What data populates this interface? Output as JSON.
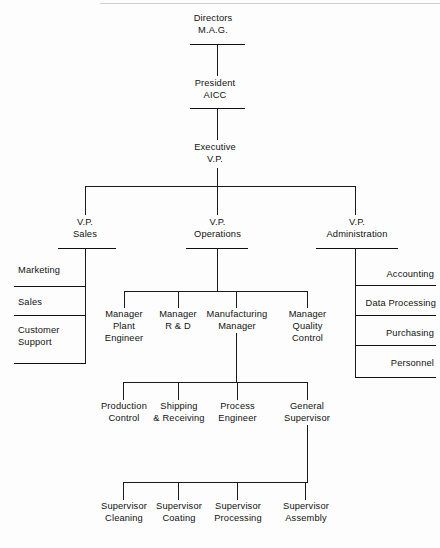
{
  "document": {
    "kind": "organization-chart",
    "line_color": "#1a1a1a",
    "text_color": "#111111",
    "background": "#fdfdfd"
  },
  "nodes": {
    "directors": {
      "line1": "Directors",
      "line2": "M.A.G."
    },
    "president": {
      "line1": "President",
      "line2": "AICC"
    },
    "executive_vp": {
      "line1": "Executive",
      "line2": "V.P."
    },
    "vp_sales": {
      "line1": "V.P.",
      "line2": "Sales"
    },
    "vp_operations": {
      "line1": "V.P.",
      "line2": "Operations"
    },
    "vp_administration": {
      "line1": "V.P.",
      "line2": "Administration"
    }
  },
  "sales_units": [
    {
      "label": "Marketing"
    },
    {
      "label": "Sales"
    },
    {
      "line1": "Customer",
      "line2": "Support"
    }
  ],
  "administration_units": [
    {
      "label": "Accounting"
    },
    {
      "label": "Data Processing"
    },
    {
      "label": "Purchasing"
    },
    {
      "label": "Personnel"
    }
  ],
  "operations_managers": [
    {
      "line1": "Manager",
      "line2": "Plant",
      "line3": "Engineer"
    },
    {
      "line1": "Manager",
      "line2": "R & D"
    },
    {
      "line1": "Manufacturing",
      "line2": "Manager"
    },
    {
      "line1": "Manager",
      "line2": "Quality",
      "line3": "Control"
    }
  ],
  "manufacturing_reports": [
    {
      "line1": "Production",
      "line2": "Control"
    },
    {
      "line1": "Shipping",
      "line2": "& Receiving"
    },
    {
      "line1": "Process",
      "line2": "Engineer"
    },
    {
      "line1": "General",
      "line2": "Supervisor"
    }
  ],
  "supervisors": [
    {
      "line1": "Supervisor",
      "line2": "Cleaning"
    },
    {
      "line1": "Supervisor",
      "line2": "Coating"
    },
    {
      "line1": "Supervisor",
      "line2": "Processing"
    },
    {
      "line1": "Supervisor",
      "line2": "Assembly"
    }
  ]
}
